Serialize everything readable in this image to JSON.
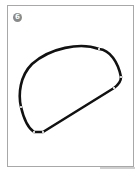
{
  "figure": {
    "step_label": "6",
    "shape": {
      "description": "closed curved outline with node markers",
      "stroke_color": "#111111",
      "node_color": "#ffffff",
      "node_count": 6
    },
    "colors": {
      "frame": "#a8a8a8",
      "badge": "#8a8a8a",
      "background": "#ffffff"
    }
  }
}
